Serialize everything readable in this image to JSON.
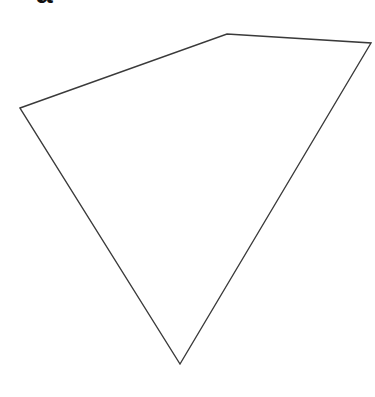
{
  "panel": {
    "label": "a"
  },
  "shape": {
    "type": "quadrilateral",
    "stroke": "#3a3a3a",
    "fill": "none",
    "vertices": [
      {
        "name": "left",
        "x": 20,
        "y": 108
      },
      {
        "name": "top",
        "x": 227,
        "y": 34
      },
      {
        "name": "right",
        "x": 371,
        "y": 43
      },
      {
        "name": "bottom",
        "x": 180,
        "y": 364
      }
    ]
  }
}
